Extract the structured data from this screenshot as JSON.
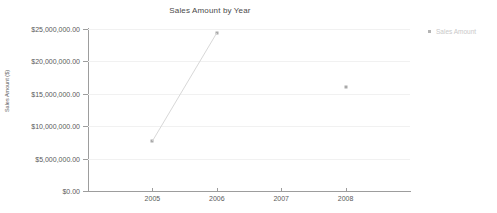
{
  "chart_data": {
    "type": "line",
    "title": "Sales Amount by Year",
    "xlabel": "",
    "ylabel": "Sales Amount ($)",
    "categories": [
      "2005",
      "2006",
      "2007",
      "2008"
    ],
    "x_tick_labels": [
      "2005",
      "2006",
      "2007",
      "2008"
    ],
    "y_tick_labels": [
      "$0.00",
      "$5,000,000.00",
      "$10,000,000.00",
      "$15,000,000.00",
      "$20,000,000.00",
      "$25,000,000.00"
    ],
    "y_tick_values": [
      0,
      5000000,
      10000000,
      15000000,
      20000000,
      25000000
    ],
    "ylim": [
      0,
      25000000
    ],
    "grid": true,
    "legend_position": "right",
    "series": [
      {
        "name": "Sales Amount",
        "x": [
          "2005",
          "2006",
          "2007",
          "2008"
        ],
        "values": [
          7700000,
          24400000,
          null,
          16100000
        ]
      }
    ],
    "segments": [
      {
        "from": "2005",
        "to": "2006"
      }
    ],
    "colors": {
      "line": "#d8d8d8",
      "marker": "#a9a9a9",
      "axis": "#9d9d9d",
      "grid": "#f1f1f1",
      "title_text": "#4a4a4a",
      "tick_text": "#5a5a5a",
      "legend_text": "#c9c9c9"
    }
  },
  "legend": {
    "items": [
      {
        "label": "Sales Amount",
        "marker": "square-marker"
      }
    ]
  }
}
